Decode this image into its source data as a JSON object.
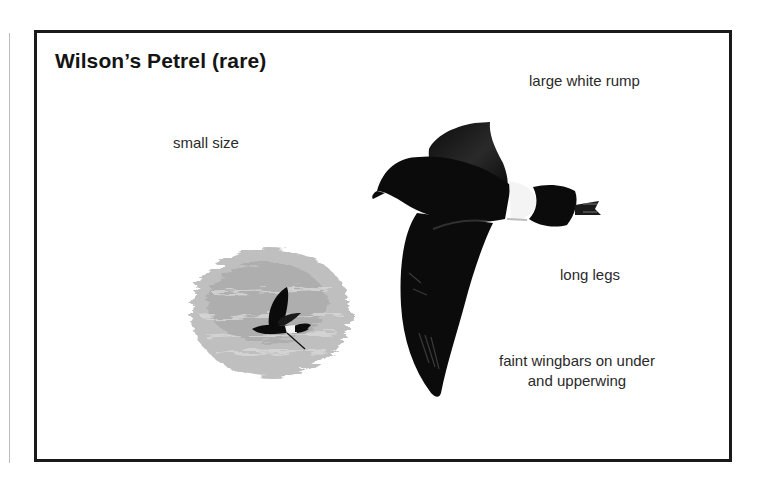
{
  "title": "Wilson’s Petrel (rare)",
  "annotations": {
    "small_size": "small size",
    "large_white_rump": "large white rump",
    "long_legs": "long legs",
    "faint_wingbars_line1": "faint wingbars on under",
    "faint_wingbars_line2": "and upperwing"
  },
  "colors": {
    "frame": "#1a1a1a",
    "bird": "#0b0b0b",
    "rump": "#f4f4f4",
    "sea": "#a9a9a9"
  }
}
